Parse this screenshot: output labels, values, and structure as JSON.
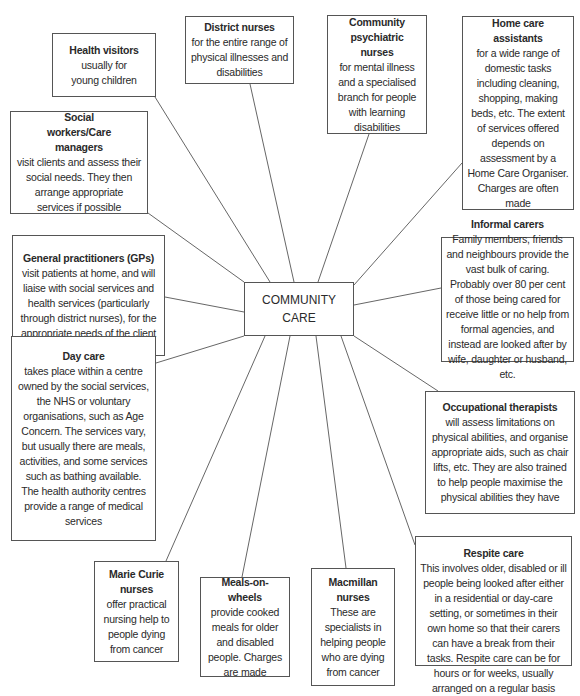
{
  "diagram": {
    "center": {
      "line1": "COMMUNITY",
      "line2": "CARE"
    },
    "nodes": [
      {
        "id": "health-visitors",
        "title": "Health visitors",
        "text": "usually for young children"
      },
      {
        "id": "district-nurses",
        "title": "District nurses",
        "text": "for the entire range of physical illnesses and disabilities"
      },
      {
        "id": "community-psychiatric-nurses",
        "title": "Community psychiatric nurses",
        "text": "for mental illness and a specialised branch for people with learning disabilities"
      },
      {
        "id": "home-care-assistants",
        "title": "Home care assistants",
        "text": "for a wide range of domestic tasks including cleaning, shopping, making beds, etc. The extent of services offered depends on assessment by a Home Care Organiser. Charges are often made"
      },
      {
        "id": "social-workers",
        "title": "Social workers/Care managers",
        "text": "visit clients and assess their social needs. They then arrange appropriate services if possible"
      },
      {
        "id": "general-practitioners",
        "title": "General practitioners (GPs)",
        "text": "visit patients at home, and will liaise with social services and health services (particularly through district nurses), for the appropriate needs of the client"
      },
      {
        "id": "informal-carers",
        "title": "Informal carers",
        "text": "Family members, friends and neighbours provide the vast bulk of caring. Probably over 80 per cent of those being cared for receive little or no help from formal agencies, and instead are looked after by wife, daughter or husband, etc."
      },
      {
        "id": "day-care",
        "title": "Day care",
        "text": "takes place within a centre owned by the social services, the NHS or voluntary organisations, such as Age Concern. The services vary, but usually there are meals, activities, and some services such as bathing available. The health authority centres provide a range of medical services"
      },
      {
        "id": "occupational-therapists",
        "title": "Occupational therapists",
        "text": "will assess limitations on physical abilities, and organise appropriate aids, such as chair lifts, etc. They are also trained to help people maximise the physical abilities they have"
      },
      {
        "id": "marie-curie-nurses",
        "title": "Marie Curie nurses",
        "text": "offer practical nursing help to people dying from cancer"
      },
      {
        "id": "meals-on-wheels",
        "title": "Meals-on-wheels",
        "text": "provide cooked meals for older and disabled people. Charges are made"
      },
      {
        "id": "macmillan-nurses",
        "title": "Macmillan nurses",
        "text": "These are specialists in helping people who are dying from cancer"
      },
      {
        "id": "respite-care",
        "title": "Respite care",
        "text": "This involves older, disabled or ill people being looked after either in a residential or day-care setting, or sometimes in their own home so that their carers can have a break from their tasks. Respite care can be for hours or for weeks, usually arranged on a regular basis"
      }
    ],
    "colors": {
      "line": "#555555",
      "border": "#555555",
      "text": "#2a2a2a",
      "background": "#ffffff"
    }
  }
}
